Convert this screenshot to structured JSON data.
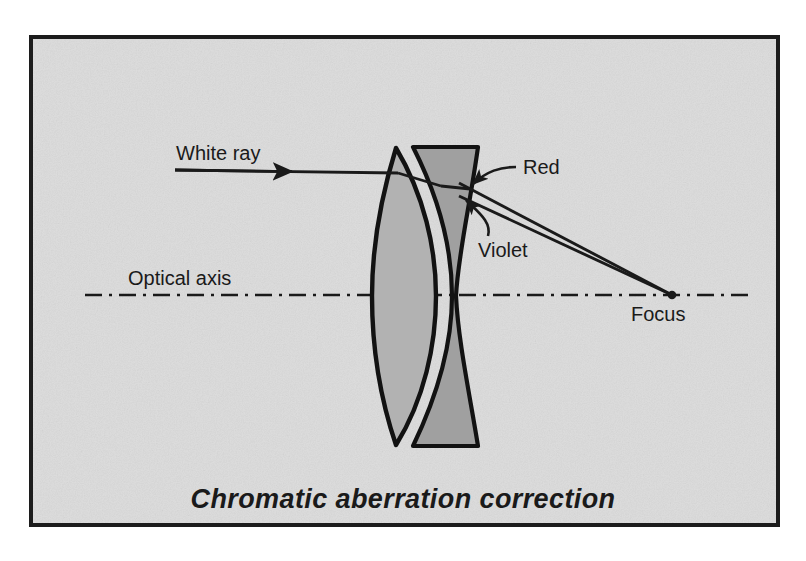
{
  "figure": {
    "title": "Chromatic aberration correction",
    "frame": {
      "border_color": "#1c1c1c",
      "background_color": "#dcdcdc",
      "page_background": "#ffffff"
    },
    "labels": {
      "white_ray": "White  ray",
      "optical_axis": "Optical  axis",
      "red": "Red",
      "violet": "Violet",
      "focus": "Focus"
    },
    "colors": {
      "ink": "#1a1a1a",
      "crown_element_fill": "#b2b2b2",
      "flint_element_fill": "#a0a0a0",
      "axis_line": "#1a1a1a",
      "ray_line": "#1a1a1a"
    },
    "elements": {
      "crown_lens_name": "biconvex crown element",
      "flint_lens_name": "concave flint element",
      "doublet_name": "achromatic doublet lens"
    },
    "geometry": {
      "axis_y": 295,
      "axis_x_start": 85,
      "axis_x_end": 748,
      "focus_x": 672,
      "focus_y": 295,
      "incoming_ray_x_start": 175,
      "incoming_ray_y": 170,
      "lens_top_y": 146,
      "lens_bottom_y": 446
    }
  }
}
